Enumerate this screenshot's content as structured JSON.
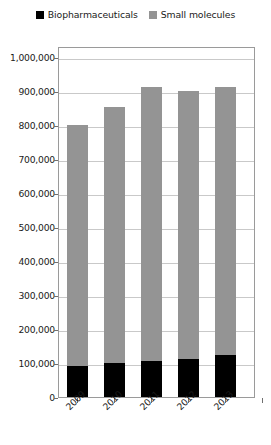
{
  "chart_data": {
    "type": "bar",
    "stacked": true,
    "title": "",
    "subtitle": "",
    "xlabel": "",
    "ylabel": "",
    "categories": [
      "2009",
      "2010",
      "2011",
      "2012",
      "2013"
    ],
    "series": [
      {
        "name": "Biopharmaceuticals",
        "color": "#000000",
        "values": [
          91000,
          100000,
          106000,
          112000,
          124000
        ]
      },
      {
        "name": "Small molecules",
        "color": "#949494",
        "values": [
          709000,
          753000,
          806000,
          788000,
          788000
        ]
      }
    ],
    "totals": [
      800000,
      853000,
      912000,
      900000,
      912000
    ],
    "ylim": [
      0,
      1000000
    ],
    "ytick_values": [
      0,
      100000,
      200000,
      300000,
      400000,
      500000,
      600000,
      700000,
      800000,
      900000,
      1000000
    ],
    "ytick_labels": [
      "0",
      "100,000",
      "200,000",
      "300,000",
      "400,000",
      "500,000",
      "600,000",
      "700,000",
      "800,000",
      "900,000",
      "1,000,000"
    ],
    "grid": true,
    "grid_axis": "y",
    "legend_position": "top-center"
  },
  "legend": {
    "entries": [
      {
        "label": "Biopharmaceuticals",
        "color": "#000000"
      },
      {
        "label": "Small molecules",
        "color": "#949494"
      }
    ]
  },
  "colors": {
    "biopharmaceuticals": "#000000",
    "small_molecules": "#949494",
    "gridline": "#c9c9c9",
    "frame": "#9a9a9a",
    "background": "#ffffff"
  }
}
